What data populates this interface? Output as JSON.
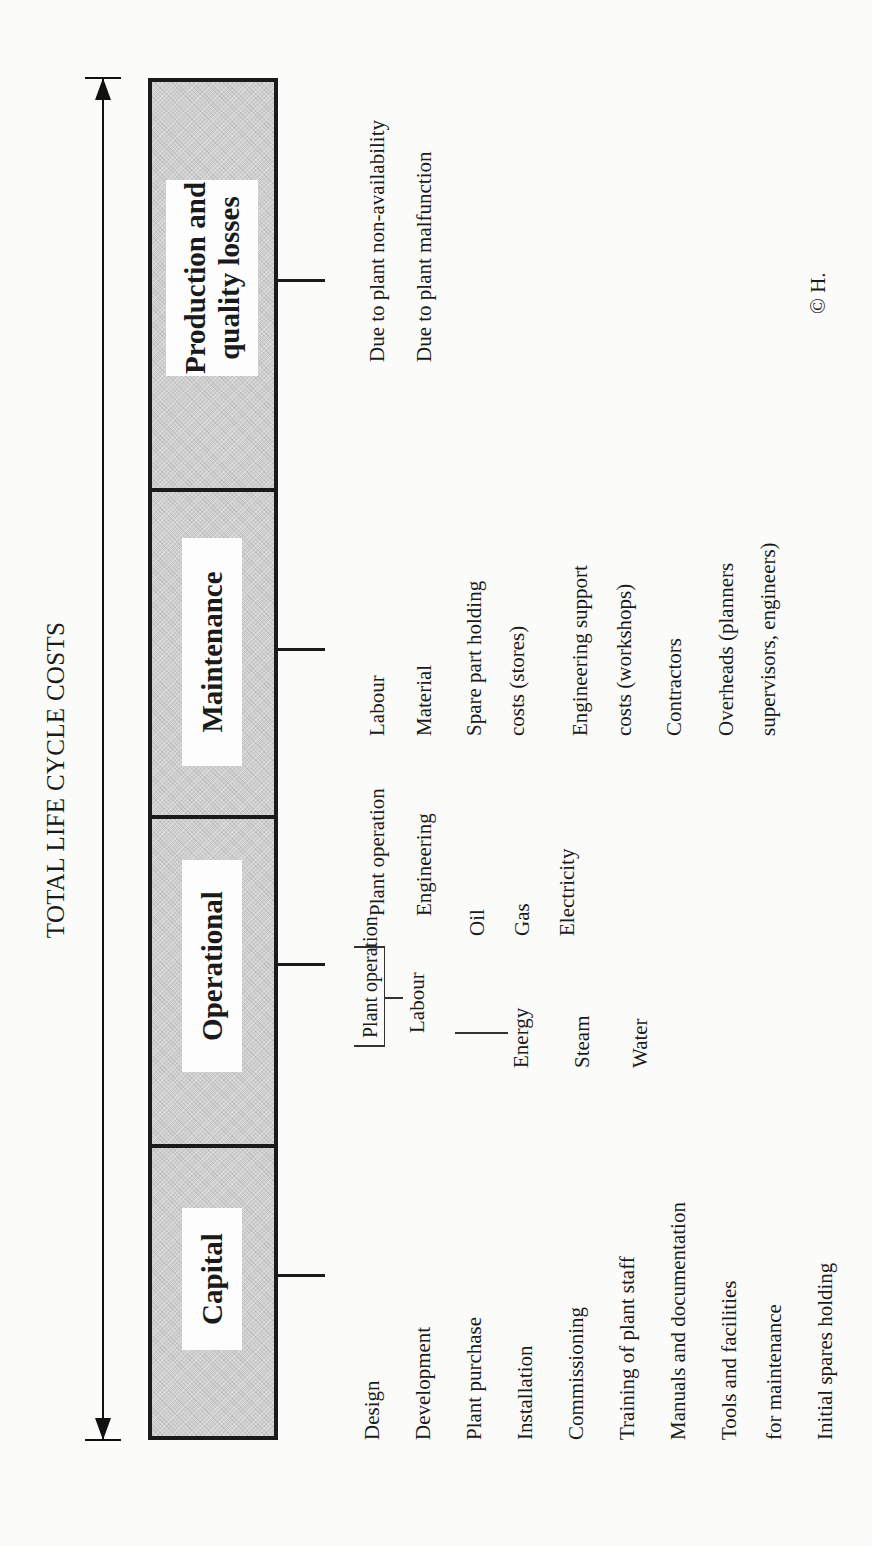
{
  "diagram": {
    "title": "TOTAL LIFE CYCLE COSTS",
    "orientation": "rotated -90deg (landscape diagram printed sideways)",
    "colors": {
      "box_fill": "#cfcfcf",
      "stroke": "#1a1a1a",
      "label_bg": "#fdfdfd",
      "paper": "#fbfbf9"
    },
    "segments": [
      {
        "label": "Capital",
        "items": [
          "Design",
          "Development",
          "Plant purchase",
          "Installation",
          "Commissioning",
          "Training of plant staff",
          "Manuals and documentation",
          "Tools and facilities",
          "for maintenance",
          "Initial spares holding"
        ]
      },
      {
        "label": "Operational",
        "labour": {
          "label": "Labour",
          "sub": [
            "Plant operation",
            "Engineering"
          ]
        },
        "energy": {
          "label": "Energy",
          "sub": [
            "Oil",
            "Gas",
            "Electricity"
          ]
        },
        "items": [
          "Steam",
          "Water"
        ]
      },
      {
        "label": "Maintenance",
        "items": [
          "Labour",
          "Material",
          "Spare part holding",
          "costs (stores)",
          "Engineering support",
          "costs (workshops)",
          "Contractors",
          "Overheads (planners",
          "supervisors, engineers)"
        ]
      },
      {
        "label_line1": "Production and",
        "label_line2": "quality losses",
        "items": [
          "Due to plant non-availability",
          "Due to plant malfunction"
        ]
      }
    ],
    "copyright": "© H."
  }
}
